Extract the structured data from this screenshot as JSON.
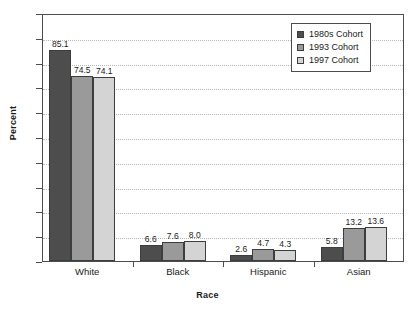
{
  "chart_data": {
    "type": "bar",
    "title": "",
    "xlabel": "Race",
    "ylabel": "Percent",
    "categories": [
      "White",
      "Black",
      "Hispanic",
      "Asian"
    ],
    "series": [
      {
        "name": "1980s Cohort",
        "color": "#4d4d4d",
        "values": [
          85.1,
          6.6,
          2.6,
          5.8
        ]
      },
      {
        "name": "1993 Cohort",
        "color": "#9a9a9a",
        "values": [
          74.5,
          7.6,
          4.7,
          13.2
        ]
      },
      {
        "name": "1997 Cohort",
        "color": "#d4d4d4",
        "values": [
          74.1,
          8.0,
          4.3,
          13.6
        ]
      }
    ],
    "value_labels": [
      [
        "85.1",
        "74.5",
        "74.1"
      ],
      [
        "6.6",
        "7.6",
        "8.0"
      ],
      [
        "2.6",
        "4.7",
        "4.3"
      ],
      [
        "5.8",
        "13.2",
        "13.6"
      ]
    ],
    "ylim": [
      0,
      100
    ],
    "yticks": [
      0,
      10,
      20,
      30,
      40,
      50,
      60,
      70,
      80,
      90,
      100
    ],
    "ytick_labels": [
      "0",
      "10",
      "20",
      "30",
      "40",
      "50",
      "60",
      "70",
      "80",
      "90",
      "100"
    ],
    "grid": true,
    "legend_position": "top-right"
  },
  "legend": {
    "items": [
      {
        "label": "1980s Cohort"
      },
      {
        "label": "1993 Cohort"
      },
      {
        "label": "1997 Cohort"
      }
    ]
  }
}
